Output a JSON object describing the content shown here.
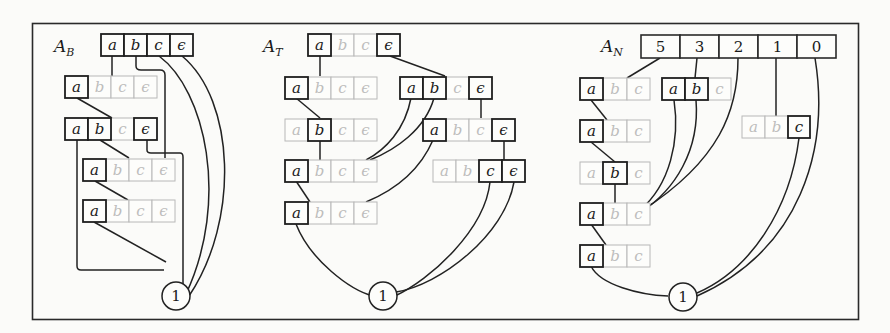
{
  "figure": {
    "panels": [
      {
        "id": "AB",
        "title": "A",
        "title_sub": "B",
        "nodes": [
          {
            "cells": [
              "a",
              "b",
              "c",
              "ϵ"
            ],
            "on": [
              1,
              1,
              1,
              1
            ]
          },
          {
            "cells": [
              "a",
              "b",
              "c",
              "ϵ"
            ],
            "on": [
              1,
              0,
              0,
              0
            ]
          },
          {
            "cells": [
              "a",
              "b",
              "c",
              "ϵ"
            ],
            "on": [
              1,
              1,
              0,
              1
            ]
          },
          {
            "cells": [
              "a",
              "b",
              "c",
              "ϵ"
            ],
            "on": [
              1,
              0,
              0,
              0
            ]
          },
          {
            "cells": [
              "a",
              "b",
              "c",
              "ϵ"
            ],
            "on": [
              1,
              0,
              0,
              0
            ]
          }
        ],
        "sink_label": "1"
      },
      {
        "id": "AT",
        "title": "A",
        "title_sub": "T",
        "nodes": [
          {
            "cells": [
              "a",
              "b",
              "c",
              "ϵ"
            ],
            "on": [
              1,
              0,
              0,
              1
            ]
          },
          {
            "cells": [
              "a",
              "b",
              "c",
              "ϵ"
            ],
            "on": [
              1,
              0,
              0,
              0
            ]
          },
          {
            "cells": [
              "a",
              "b",
              "c",
              "ϵ"
            ],
            "on": [
              1,
              1,
              0,
              1
            ]
          },
          {
            "cells": [
              "a",
              "b",
              "c",
              "ϵ"
            ],
            "on": [
              0,
              1,
              0,
              0
            ]
          },
          {
            "cells": [
              "a",
              "b",
              "c",
              "ϵ"
            ],
            "on": [
              1,
              0,
              0,
              1
            ]
          },
          {
            "cells": [
              "a",
              "b",
              "c",
              "ϵ"
            ],
            "on": [
              1,
              0,
              0,
              0
            ]
          },
          {
            "cells": [
              "a",
              "b",
              "c",
              "ϵ"
            ],
            "on": [
              0,
              0,
              1,
              1
            ]
          },
          {
            "cells": [
              "a",
              "b",
              "c",
              "ϵ"
            ],
            "on": [
              1,
              0,
              0,
              0
            ]
          }
        ],
        "sink_label": "1"
      },
      {
        "id": "AN",
        "title": "A",
        "title_sub": "N",
        "root_cells": [
          "5",
          "3",
          "2",
          "1",
          "0"
        ],
        "nodes": [
          {
            "cells": [
              "a",
              "b",
              "c"
            ],
            "on": [
              1,
              0,
              0
            ]
          },
          {
            "cells": [
              "a",
              "b",
              "c"
            ],
            "on": [
              1,
              1,
              0
            ]
          },
          {
            "cells": [
              "a",
              "b",
              "c"
            ],
            "on": [
              1,
              0,
              0
            ]
          },
          {
            "cells": [
              "a",
              "b",
              "c"
            ],
            "on": [
              0,
              0,
              1
            ]
          },
          {
            "cells": [
              "a",
              "b",
              "c"
            ],
            "on": [
              0,
              1,
              0
            ]
          },
          {
            "cells": [
              "a",
              "b",
              "c"
            ],
            "on": [
              1,
              0,
              0
            ]
          },
          {
            "cells": [
              "a",
              "b",
              "c"
            ],
            "on": [
              1,
              0,
              0
            ]
          }
        ],
        "sink_label": "1"
      }
    ]
  }
}
